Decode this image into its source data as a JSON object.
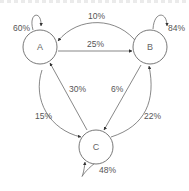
{
  "diagram": {
    "type": "markov-chain",
    "nodes": [
      {
        "id": "A",
        "label": "A"
      },
      {
        "id": "B",
        "label": "B"
      },
      {
        "id": "C",
        "label": "C"
      }
    ],
    "edges": [
      {
        "from": "A",
        "to": "A",
        "label": "60%",
        "prob": 0.6
      },
      {
        "from": "B",
        "to": "B",
        "label": "84%",
        "prob": 0.84
      },
      {
        "from": "C",
        "to": "C",
        "label": "48%",
        "prob": 0.48
      },
      {
        "from": "B",
        "to": "A",
        "label": "10%",
        "prob": 0.1
      },
      {
        "from": "A",
        "to": "B",
        "label": "25%",
        "prob": 0.25
      },
      {
        "from": "C",
        "to": "A",
        "label": "30%",
        "prob": 0.3
      },
      {
        "from": "A",
        "to": "C",
        "label": "15%",
        "prob": 0.15
      },
      {
        "from": "B",
        "to": "C",
        "label": "6%",
        "prob": 0.06
      },
      {
        "from": "C",
        "to": "B",
        "label": "22%",
        "prob": 0.22
      }
    ],
    "colors": {
      "stroke": "#555555",
      "text": "#555555"
    }
  }
}
